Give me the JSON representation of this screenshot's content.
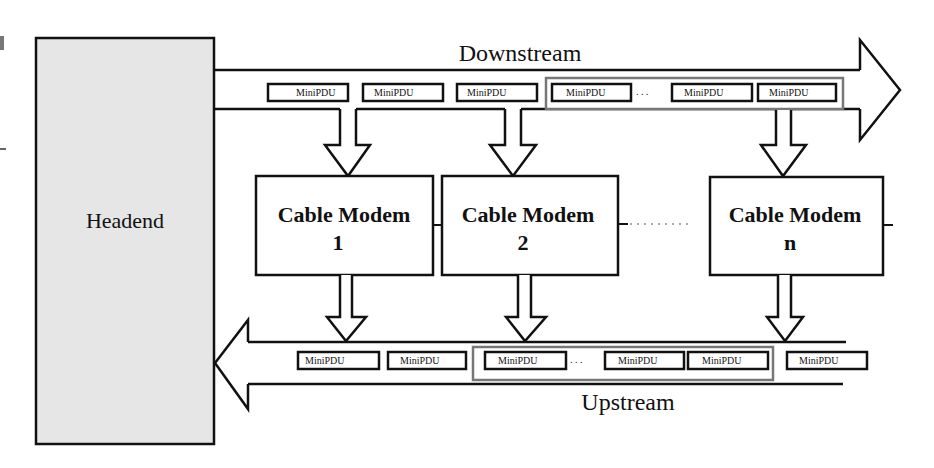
{
  "diagram": {
    "headend": {
      "label": "Headend",
      "fill": "#e6e6e6"
    },
    "downstream": {
      "label": "Downstream",
      "pdus": [
        "MiniPDU",
        "MiniPDU",
        "MiniPDU"
      ],
      "group_pdus": [
        "MiniPDU",
        "MiniPDU",
        "MiniPDU"
      ],
      "group_ellipsis": ". . ."
    },
    "modems": [
      {
        "line1": "Cable Modem",
        "line2": "1"
      },
      {
        "line1": "Cable Modem",
        "line2": "2"
      },
      {
        "line1": "Cable Modem",
        "line2": "n"
      }
    ],
    "upstream": {
      "label": "Upstream",
      "pdus": [
        "MiniPDU",
        "MiniPDU"
      ],
      "group_pdus": [
        "MiniPDU",
        "MiniPDU",
        "MiniPDU"
      ],
      "group_ellipsis": ". . .",
      "trailing_pdu": "MiniPDU"
    },
    "colors": {
      "stroke": "#111111",
      "group_stroke": "#777777",
      "background": "#ffffff"
    }
  }
}
